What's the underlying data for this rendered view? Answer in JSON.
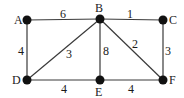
{
  "graph": {
    "nodes": [
      {
        "id": "A",
        "x": 27,
        "y": 20,
        "lx": 14,
        "ly": 24
      },
      {
        "id": "B",
        "x": 100,
        "y": 19,
        "lx": 95,
        "ly": 12
      },
      {
        "id": "C",
        "x": 163,
        "y": 20,
        "lx": 169,
        "ly": 24
      },
      {
        "id": "D",
        "x": 27,
        "y": 80,
        "lx": 12,
        "ly": 84
      },
      {
        "id": "E",
        "x": 100,
        "y": 80,
        "lx": 95,
        "ly": 96
      },
      {
        "id": "F",
        "x": 163,
        "y": 80,
        "lx": 169,
        "ly": 84
      }
    ],
    "edges": [
      {
        "from": "A",
        "to": "B",
        "weight": "6",
        "lx": 60,
        "ly": 18
      },
      {
        "from": "B",
        "to": "C",
        "weight": "1",
        "lx": 127,
        "ly": 18
      },
      {
        "from": "A",
        "to": "D",
        "weight": "4",
        "lx": 18,
        "ly": 55
      },
      {
        "from": "B",
        "to": "D",
        "weight": "3",
        "lx": 66,
        "ly": 58
      },
      {
        "from": "B",
        "to": "E",
        "weight": "8",
        "lx": 103,
        "ly": 55
      },
      {
        "from": "B",
        "to": "F",
        "weight": "2",
        "lx": 132,
        "ly": 48
      },
      {
        "from": "C",
        "to": "F",
        "weight": "3",
        "lx": 165,
        "ly": 55
      },
      {
        "from": "D",
        "to": "E",
        "weight": "4",
        "lx": 61,
        "ly": 93
      },
      {
        "from": "E",
        "to": "F",
        "weight": "4",
        "lx": 128,
        "ly": 93
      }
    ],
    "edge_color": "#3a3a3a",
    "node_color": "#111111"
  }
}
